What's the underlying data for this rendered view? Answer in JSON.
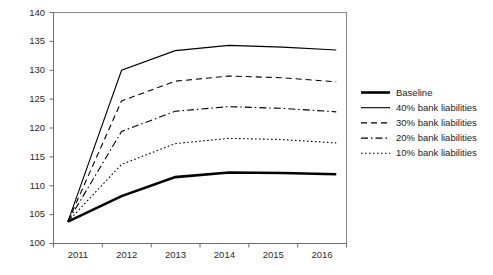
{
  "chart_data": {
    "type": "line",
    "title": "",
    "subtitle": "",
    "xlabel": "",
    "ylabel": "",
    "x": [
      "2011",
      "2012",
      "2013",
      "2014",
      "2015",
      "2016"
    ],
    "xlim": [
      2011,
      2016
    ],
    "ylim": [
      100,
      140
    ],
    "yticks": [
      100,
      105,
      110,
      115,
      120,
      125,
      130,
      135,
      140
    ],
    "xticks": [
      "2011",
      "2012",
      "2013",
      "2014",
      "2015",
      "2016"
    ],
    "grid": false,
    "legend_position": "right",
    "series": [
      {
        "name": "Baseline",
        "style": "solid-thick",
        "stroke_width": 2.6,
        "dash": "none",
        "color": "#000000",
        "values": [
          103.8,
          108.2,
          111.5,
          112.3,
          112.2,
          112.0
        ]
      },
      {
        "name": "40% bank liabilities",
        "style": "solid",
        "stroke_width": 1.1,
        "dash": "none",
        "color": "#000000",
        "values": [
          103.8,
          130.0,
          133.4,
          134.3,
          134.0,
          133.5
        ]
      },
      {
        "name": "30% bank liabilities",
        "style": "dashed",
        "stroke_width": 1.1,
        "dash": "6,4",
        "color": "#000000",
        "values": [
          103.8,
          124.7,
          128.1,
          129.0,
          128.7,
          128.0
        ]
      },
      {
        "name": "20% bank liabilities",
        "style": "dash-dot",
        "stroke_width": 1.1,
        "dash": "7,3,1.5,3",
        "color": "#000000",
        "values": [
          103.8,
          119.4,
          122.9,
          123.7,
          123.4,
          122.8
        ]
      },
      {
        "name": "10% bank liabilities",
        "style": "dotted",
        "stroke_width": 1.1,
        "dash": "1.6,2.4",
        "color": "#000000",
        "values": [
          103.8,
          113.7,
          117.3,
          118.2,
          118.0,
          117.4
        ]
      }
    ]
  },
  "axes": {
    "y_tick_labels": [
      "140",
      "135",
      "130",
      "125",
      "120",
      "115",
      "110",
      "105",
      "100"
    ],
    "x_tick_labels": [
      "2011",
      "2012",
      "2013",
      "2014",
      "2015",
      "2016"
    ]
  },
  "legend": {
    "items": [
      {
        "label": "Baseline",
        "swatch": "solid-thick-line-icon"
      },
      {
        "label": "40% bank liabilities",
        "swatch": "solid-line-icon"
      },
      {
        "label": "30% bank liabilities",
        "swatch": "dashed-line-icon"
      },
      {
        "label": "20% bank liabilities",
        "swatch": "dash-dot-line-icon"
      },
      {
        "label": "10% bank liabilities",
        "swatch": "dotted-line-icon"
      }
    ]
  },
  "colors": {
    "plot_background": "#ffffff",
    "axis": "#6e6e6e",
    "series_stroke": "#000000",
    "text": "#1b1b1b"
  }
}
